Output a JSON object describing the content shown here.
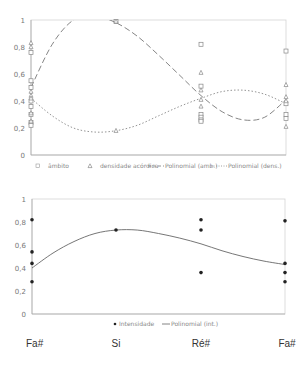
{
  "chart_data": [
    {
      "type": "scatter",
      "title": "",
      "xlabel": "",
      "ylabel": "",
      "ylim": [
        0,
        1
      ],
      "yticks": [
        "0",
        "0,2",
        "0,4",
        "0,6",
        "0,8",
        "1"
      ],
      "grid": false,
      "legend_placement": "bottom",
      "categories": [
        "Fa#",
        "Si",
        "Ré#",
        "Fa#"
      ],
      "series": [
        {
          "name": "âmbito",
          "marker": "square-open",
          "points": [
            {
              "x": 0,
              "y": 0.76
            },
            {
              "x": 0,
              "y": 0.55
            },
            {
              "x": 0,
              "y": 0.5
            },
            {
              "x": 0,
              "y": 0.4
            },
            {
              "x": 0,
              "y": 0.36
            },
            {
              "x": 0,
              "y": 0.3
            },
            {
              "x": 0,
              "y": 0.24
            },
            {
              "x": 0,
              "y": 0.22
            },
            {
              "x": 1,
              "y": 0.99
            },
            {
              "x": 2,
              "y": 0.82
            },
            {
              "x": 2,
              "y": 0.51
            },
            {
              "x": 2,
              "y": 0.3
            },
            {
              "x": 2,
              "y": 0.28
            },
            {
              "x": 2,
              "y": 0.26
            },
            {
              "x": 2,
              "y": 0.25
            },
            {
              "x": 3,
              "y": 0.77
            },
            {
              "x": 3,
              "y": 0.38
            },
            {
              "x": 3,
              "y": 0.3
            },
            {
              "x": 3,
              "y": 0.27
            }
          ]
        },
        {
          "name": "densidade acórdica",
          "marker": "triangle-open",
          "points": [
            {
              "x": 0,
              "y": 0.83
            },
            {
              "x": 0,
              "y": 0.8
            },
            {
              "x": 0,
              "y": 0.47
            },
            {
              "x": 0,
              "y": 0.44
            },
            {
              "x": 0,
              "y": 0.42
            },
            {
              "x": 0,
              "y": 0.31
            },
            {
              "x": 0,
              "y": 0.25
            },
            {
              "x": 1,
              "y": 0.99
            },
            {
              "x": 1,
              "y": 0.18
            },
            {
              "x": 2,
              "y": 0.61
            },
            {
              "x": 2,
              "y": 0.48
            },
            {
              "x": 2,
              "y": 0.41
            },
            {
              "x": 2,
              "y": 0.36
            },
            {
              "x": 3,
              "y": 0.52
            },
            {
              "x": 3,
              "y": 0.43
            },
            {
              "x": 3,
              "y": 0.4
            },
            {
              "x": 3,
              "y": 0.21
            }
          ]
        },
        {
          "name": "Polinomial (amb.)",
          "type": "line",
          "style": "long-dash",
          "x": [
            0,
            0.25,
            0.5,
            0.75,
            1,
            1.25,
            1.5,
            1.75,
            2,
            2.25,
            2.5,
            2.75,
            3
          ],
          "values": [
            0.5,
            0.82,
            1.0,
            1.03,
            0.98,
            0.88,
            0.74,
            0.59,
            0.44,
            0.32,
            0.26,
            0.28,
            0.41
          ]
        },
        {
          "name": "Polinomial (dens.)",
          "type": "line",
          "style": "dotted",
          "x": [
            0,
            0.25,
            0.5,
            0.75,
            1,
            1.25,
            1.5,
            1.75,
            2,
            2.25,
            2.5,
            2.75,
            3
          ],
          "values": [
            0.42,
            0.29,
            0.2,
            0.17,
            0.18,
            0.22,
            0.29,
            0.36,
            0.42,
            0.47,
            0.48,
            0.45,
            0.38
          ]
        }
      ]
    },
    {
      "type": "scatter",
      "title": "",
      "xlabel": "",
      "ylabel": "",
      "ylim": [
        0,
        1
      ],
      "yticks": [
        "0",
        "0,2",
        "0,4",
        "0,6",
        "0,8",
        "1"
      ],
      "grid": false,
      "legend_placement": "bottom",
      "categories": [
        "Fa#",
        "Si",
        "Ré#",
        "Fa#"
      ],
      "series": [
        {
          "name": "Intensidade",
          "marker": "dot",
          "points": [
            {
              "x": 0,
              "y": 0.82
            },
            {
              "x": 0,
              "y": 0.54
            },
            {
              "x": 0,
              "y": 0.44
            },
            {
              "x": 0,
              "y": 0.28
            },
            {
              "x": 1,
              "y": 0.73
            },
            {
              "x": 2,
              "y": 0.82
            },
            {
              "x": 2,
              "y": 0.73
            },
            {
              "x": 2,
              "y": 0.36
            },
            {
              "x": 3,
              "y": 0.81
            },
            {
              "x": 3,
              "y": 0.44
            },
            {
              "x": 3,
              "y": 0.36
            },
            {
              "x": 3,
              "y": 0.28
            }
          ]
        },
        {
          "name": "Polinomial (int.)",
          "type": "line",
          "style": "solid",
          "x": [
            0,
            0.25,
            0.5,
            0.75,
            1,
            1.25,
            1.5,
            1.75,
            2,
            2.25,
            2.5,
            2.75,
            3
          ],
          "values": [
            0.4,
            0.53,
            0.63,
            0.7,
            0.73,
            0.73,
            0.7,
            0.66,
            0.61,
            0.55,
            0.5,
            0.46,
            0.43
          ]
        }
      ]
    }
  ],
  "x_labels": [
    "Fa#",
    "Si",
    "Ré#",
    "Fa#"
  ]
}
